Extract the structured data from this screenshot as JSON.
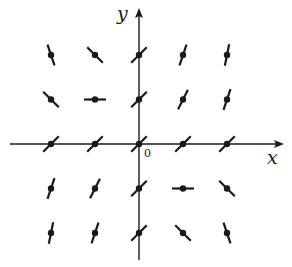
{
  "diagram": {
    "title": "",
    "type": "slope-field",
    "equation_implied": "dy/dx = 1 + xy",
    "axes": {
      "x_label": "x",
      "y_label": "y",
      "origin_label": "0"
    },
    "colors": {
      "stroke": "#1a1a1a",
      "background": "#ffffff"
    },
    "grid": {
      "x_values": [
        -2,
        -1,
        0,
        1,
        2
      ],
      "y_values": [
        2,
        1,
        0,
        -1,
        -2
      ]
    },
    "segments": [
      {
        "x": -2,
        "y": 2,
        "slope": -3
      },
      {
        "x": -1,
        "y": 2,
        "slope": -1
      },
      {
        "x": 0,
        "y": 2,
        "slope": 1
      },
      {
        "x": 1,
        "y": 2,
        "slope": 3
      },
      {
        "x": 2,
        "y": 2,
        "slope": 5
      },
      {
        "x": -2,
        "y": 1,
        "slope": -1
      },
      {
        "x": -1,
        "y": 1,
        "slope": 0
      },
      {
        "x": 0,
        "y": 1,
        "slope": 1
      },
      {
        "x": 1,
        "y": 1,
        "slope": 2
      },
      {
        "x": 2,
        "y": 1,
        "slope": 3
      },
      {
        "x": -2,
        "y": 0,
        "slope": 1
      },
      {
        "x": -1,
        "y": 0,
        "slope": 1
      },
      {
        "x": 0,
        "y": 0,
        "slope": 1
      },
      {
        "x": 1,
        "y": 0,
        "slope": 1
      },
      {
        "x": 2,
        "y": 0,
        "slope": 1
      },
      {
        "x": -2,
        "y": -1,
        "slope": 3
      },
      {
        "x": -1,
        "y": -1,
        "slope": 2
      },
      {
        "x": 0,
        "y": -1,
        "slope": 1
      },
      {
        "x": 1,
        "y": -1,
        "slope": 0
      },
      {
        "x": 2,
        "y": -1,
        "slope": -1
      },
      {
        "x": -2,
        "y": -2,
        "slope": 5
      },
      {
        "x": -1,
        "y": -2,
        "slope": 3
      },
      {
        "x": 0,
        "y": -2,
        "slope": 1
      },
      {
        "x": 1,
        "y": -2,
        "slope": -1
      },
      {
        "x": 2,
        "y": -2,
        "slope": -3
      }
    ]
  }
}
